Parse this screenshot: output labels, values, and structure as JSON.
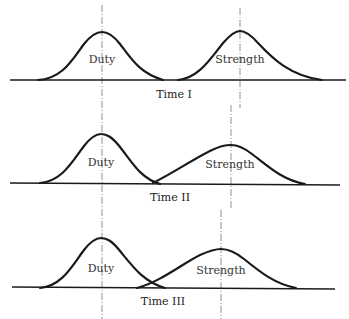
{
  "figure": {
    "panels": [
      {
        "label": "Time I",
        "baseline_y": 80,
        "curves": [
          {
            "name": "Duty",
            "peak_x": 102,
            "peak_y": 32,
            "start_x": 38,
            "end_x": 163
          },
          {
            "name": "Strength",
            "peak_x": 240,
            "peak_y": 31,
            "start_x": 178,
            "end_x": 322
          }
        ]
      },
      {
        "label": "Time II",
        "baseline_y": 183,
        "curves": [
          {
            "name": "Duty",
            "peak_x": 101,
            "peak_y": 134,
            "start_x": 40,
            "end_x": 160
          },
          {
            "name": "Strength",
            "peak_x": 231,
            "peak_y": 145,
            "start_x": 153,
            "end_x": 305
          }
        ]
      },
      {
        "label": "Time III",
        "baseline_y": 288,
        "curves": [
          {
            "name": "Duty",
            "peak_x": 101,
            "peak_y": 238,
            "start_x": 40,
            "end_x": 165
          },
          {
            "name": "Strength",
            "peak_x": 221,
            "peak_y": 249,
            "start_x": 137,
            "end_x": 296
          }
        ]
      }
    ],
    "labels": {
      "p1_duty": "Duty",
      "p1_strength": "Strength",
      "p1_time": "Time I",
      "p2_duty": "Duty",
      "p2_strength": "Strength",
      "p2_time": "Time II",
      "p3_duty": "Duty",
      "p3_strength": "Strength",
      "p3_time": "Time III"
    }
  }
}
